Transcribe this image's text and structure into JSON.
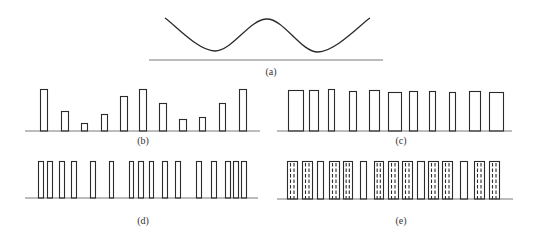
{
  "figure": {
    "colors": {
      "stroke": "#2b2b2b",
      "axis": "#7a7a7a",
      "label": "#333333",
      "background": "#ffffff"
    },
    "panels": [
      {
        "id": "a",
        "label": "(a)",
        "type": "curve",
        "description": "double-well continuous waveform",
        "baseline": {
          "y": 60,
          "x1": 149,
          "x2": 383
        },
        "label_pos": {
          "x": 271,
          "y": 75
        },
        "curve_points": [
          [
            165,
            18
          ],
          [
            215,
            51
          ],
          [
            267,
            19
          ],
          [
            318,
            52
          ],
          [
            370,
            18
          ]
        ]
      },
      {
        "id": "b",
        "label": "(b)",
        "type": "pulse-amplitude",
        "description": "sampled pulses with varying height",
        "baseline": {
          "y": 131,
          "x1": 25,
          "x2": 260
        },
        "label_pos": {
          "x": 143,
          "y": 144
        },
        "bars": [
          {
            "x": 40,
            "w": 7,
            "top": 89
          },
          {
            "x": 61,
            "w": 7,
            "top": 111
          },
          {
            "x": 81,
            "w": 6,
            "top": 123
          },
          {
            "x": 101,
            "w": 6,
            "top": 114
          },
          {
            "x": 120,
            "w": 7,
            "top": 96
          },
          {
            "x": 139,
            "w": 7,
            "top": 89
          },
          {
            "x": 159,
            "w": 7,
            "top": 103
          },
          {
            "x": 179,
            "w": 7,
            "top": 119
          },
          {
            "x": 199,
            "w": 6,
            "top": 117
          },
          {
            "x": 219,
            "w": 6,
            "top": 103
          },
          {
            "x": 239,
            "w": 7,
            "top": 89
          }
        ]
      },
      {
        "id": "c",
        "label": "(c)",
        "type": "pulse-width",
        "description": "pulses with equal height and varying width",
        "baseline": {
          "y": 131,
          "x1": 277,
          "x2": 512
        },
        "label_pos": {
          "x": 401,
          "y": 144
        },
        "bars": [
          {
            "x": 288,
            "w": 15,
            "top": 90
          },
          {
            "x": 309,
            "w": 9,
            "top": 90
          },
          {
            "x": 328,
            "w": 6,
            "top": 89
          },
          {
            "x": 349,
            "w": 7,
            "top": 91
          },
          {
            "x": 369,
            "w": 10,
            "top": 90
          },
          {
            "x": 388,
            "w": 13,
            "top": 92
          },
          {
            "x": 409,
            "w": 8,
            "top": 91
          },
          {
            "x": 429,
            "w": 6,
            "top": 91
          },
          {
            "x": 449,
            "w": 6,
            "top": 92
          },
          {
            "x": 469,
            "w": 11,
            "top": 91
          },
          {
            "x": 489,
            "w": 14,
            "top": 92
          }
        ]
      },
      {
        "id": "d",
        "label": "(d)",
        "type": "pulse-position",
        "description": "narrow equal pulses with varying density",
        "baseline": {
          "y": 198,
          "x1": 25,
          "x2": 258
        },
        "label_pos": {
          "x": 143,
          "y": 224
        },
        "bars": [
          {
            "x": 38,
            "w": 5,
            "top": 161
          },
          {
            "x": 47,
            "w": 5,
            "top": 161
          },
          {
            "x": 59,
            "w": 5,
            "top": 161
          },
          {
            "x": 71,
            "w": 5,
            "top": 161
          },
          {
            "x": 90,
            "w": 5,
            "top": 161
          },
          {
            "x": 109,
            "w": 4,
            "top": 161
          },
          {
            "x": 129,
            "w": 4,
            "top": 161
          },
          {
            "x": 138,
            "w": 5,
            "top": 161
          },
          {
            "x": 149,
            "w": 4,
            "top": 161
          },
          {
            "x": 162,
            "w": 5,
            "top": 161
          },
          {
            "x": 175,
            "w": 5,
            "top": 161
          },
          {
            "x": 196,
            "w": 5,
            "top": 161
          },
          {
            "x": 211,
            "w": 5,
            "top": 161
          },
          {
            "x": 225,
            "w": 5,
            "top": 161
          },
          {
            "x": 233,
            "w": 5,
            "top": 161
          },
          {
            "x": 241,
            "w": 5,
            "top": 161
          }
        ]
      },
      {
        "id": "e",
        "label": "(e)",
        "type": "pulse-hatched",
        "description": "equal-height pulses, most with internal dashed lines",
        "baseline": {
          "y": 199,
          "x1": 277,
          "x2": 513
        },
        "label_pos": {
          "x": 401,
          "y": 224
        },
        "bars": [
          {
            "x": 287,
            "w": 10,
            "top": 161,
            "dashed": true
          },
          {
            "x": 302,
            "w": 10,
            "top": 161,
            "dashed": true
          },
          {
            "x": 317,
            "w": 6,
            "top": 161,
            "dashed": false
          },
          {
            "x": 329,
            "w": 10,
            "top": 161,
            "dashed": true
          },
          {
            "x": 343,
            "w": 9,
            "top": 161,
            "dashed": true
          },
          {
            "x": 360,
            "w": 6,
            "top": 161,
            "dashed": false
          },
          {
            "x": 374,
            "w": 9,
            "top": 161,
            "dashed": true
          },
          {
            "x": 388,
            "w": 10,
            "top": 161,
            "dashed": true
          },
          {
            "x": 402,
            "w": 10,
            "top": 161,
            "dashed": true
          },
          {
            "x": 417,
            "w": 7,
            "top": 161,
            "dashed": false
          },
          {
            "x": 428,
            "w": 10,
            "top": 161,
            "dashed": true
          },
          {
            "x": 442,
            "w": 10,
            "top": 161,
            "dashed": true
          },
          {
            "x": 460,
            "w": 7,
            "top": 161,
            "dashed": false
          },
          {
            "x": 474,
            "w": 10,
            "top": 161,
            "dashed": true
          },
          {
            "x": 489,
            "w": 10,
            "top": 161,
            "dashed": true
          }
        ]
      }
    ]
  }
}
